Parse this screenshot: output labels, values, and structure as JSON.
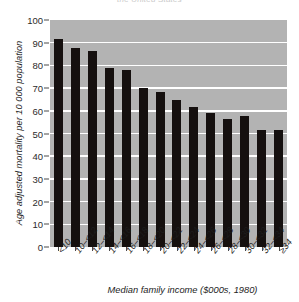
{
  "chart_data": {
    "type": "bar",
    "title": "the United States",
    "xlabel": "Median family income ($000s, 1980)",
    "ylabel": "Age adjusted mortality per 10 000 population",
    "categories": [
      "<10",
      "10–<12",
      "12–<14",
      "14–<16",
      "16–<18",
      "18–<20",
      "20–<22",
      "22–<24",
      "24–<26",
      "26–<28",
      "28–<30",
      "30–<32",
      "32–<34",
      "≥34"
    ],
    "values": [
      91.5,
      87.6,
      86.2,
      78.8,
      78.0,
      70.2,
      68.1,
      64.6,
      61.7,
      59.0,
      56.6,
      57.9,
      51.7,
      51.4
    ],
    "ylim": [
      0,
      100
    ],
    "yticks": [
      0,
      10,
      20,
      30,
      40,
      50,
      60,
      70,
      80,
      90,
      100
    ],
    "ytick_labels": [
      "0",
      "10",
      "20",
      "30",
      "40",
      "50",
      "60",
      "70",
      "80",
      "90",
      "100"
    ],
    "grid": "horizontal-white",
    "legend": "none",
    "colors": {
      "bar": "#15100f",
      "plot_background": "#b3b3b3",
      "gridline": "#ffffff",
      "text": "#1d1d1d",
      "figure_background": "#ffffff"
    }
  }
}
